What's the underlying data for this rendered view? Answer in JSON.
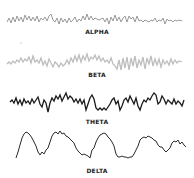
{
  "waves": [
    {
      "label": "ALPHA",
      "color": "#9a9a9a"
    },
    {
      "label": "BETA",
      "color": "#bdbdbd"
    },
    {
      "label": "THETA",
      "color": "#1a1a1a"
    },
    {
      "label": "DELTA",
      "color": "#2a2a2a"
    }
  ]
}
